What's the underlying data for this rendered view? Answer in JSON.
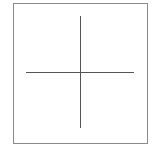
{
  "diagram": {
    "type": "crosshair-in-frame",
    "frame": {
      "border_color": "#8a8a8a",
      "background": "#ffffff"
    },
    "crosshair": {
      "line_color": "#555555",
      "center": [
        80,
        72
      ]
    }
  }
}
